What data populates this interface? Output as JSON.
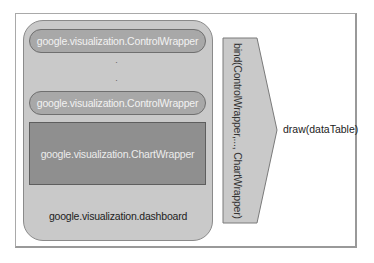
{
  "diagram": {
    "dashboard_label": "google.visualization.dashboard",
    "control_wrappers": [
      {
        "label": "google.visualization.ControlWrapper"
      },
      {
        "label": "google.visualization.ControlWrapper"
      }
    ],
    "ellipsis": ".\n.\n.",
    "chart_wrapper": {
      "label": "google.visualization.ChartWrapper"
    },
    "bind_label": "bind(ControlWrapper,..., ChartWrapper)",
    "draw_label": "draw(dataTable)"
  }
}
